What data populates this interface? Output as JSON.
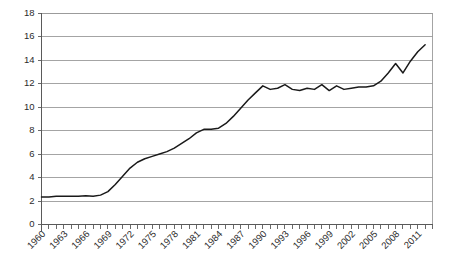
{
  "chart_data": {
    "type": "line",
    "title": "",
    "subtitle": "",
    "xlabel": "",
    "ylabel": "",
    "grid": true,
    "legend": false,
    "legend_position": "none",
    "line_color": "#1a1a1a",
    "grid_color": "#9a9a9a",
    "background_color": "#ffffff",
    "xlim": [
      1960,
      2013
    ],
    "ylim": [
      0,
      18
    ],
    "ytick_values": [
      0,
      2,
      4,
      6,
      8,
      10,
      12,
      14,
      16,
      18
    ],
    "ytick_labels": [
      "0",
      "2",
      "4",
      "6",
      "8",
      "10",
      "12",
      "14",
      "16",
      "18"
    ],
    "xtick_labels": [
      "1960",
      "1963",
      "1966",
      "1969",
      "1972",
      "1975",
      "1978",
      "1981",
      "1984",
      "1987",
      "1990",
      "1993",
      "1996",
      "1999",
      "2002",
      "2005",
      "2008",
      "2011"
    ],
    "xtick_label_interval": 3,
    "xtick_minor_interval": 1,
    "x": [
      1960,
      1961,
      1962,
      1963,
      1964,
      1965,
      1966,
      1967,
      1968,
      1969,
      1970,
      1971,
      1972,
      1973,
      1974,
      1975,
      1976,
      1977,
      1978,
      1979,
      1980,
      1981,
      1982,
      1983,
      1984,
      1985,
      1986,
      1987,
      1988,
      1989,
      1990,
      1991,
      1992,
      1993,
      1994,
      1995,
      1996,
      1997,
      1998,
      1999,
      2000,
      2001,
      2002,
      2003,
      2004,
      2005,
      2006,
      2007,
      2008,
      2009,
      2010,
      2011,
      2012
    ],
    "series": [
      {
        "name": "value",
        "values": [
          2.35,
          2.35,
          2.4,
          2.4,
          2.4,
          2.4,
          2.45,
          2.4,
          2.5,
          2.8,
          3.4,
          4.1,
          4.8,
          5.3,
          5.6,
          5.8,
          6.0,
          6.2,
          6.5,
          6.9,
          7.3,
          7.8,
          8.1,
          8.1,
          8.2,
          8.6,
          9.2,
          9.9,
          10.6,
          11.2,
          11.8,
          11.5,
          11.6,
          11.9,
          11.5,
          11.4,
          11.6,
          11.5,
          11.9,
          11.4,
          11.8,
          11.5,
          11.6,
          11.7,
          11.7,
          11.8,
          12.2,
          12.9,
          13.7,
          12.9,
          13.9,
          14.7,
          15.3
        ]
      }
    ]
  }
}
